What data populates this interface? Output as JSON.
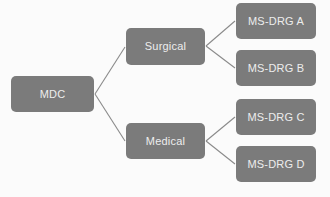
{
  "diagram": {
    "background_color": "#fbfbfb",
    "node_fill_color": "#7b7b7b",
    "node_text_color": "#ededed",
    "edge_color": "#8a8a8a",
    "nodes": [
      {
        "id": "mdc",
        "label": "MDC",
        "level": 1
      },
      {
        "id": "surgical",
        "label": "Surgical",
        "level": 2
      },
      {
        "id": "medical",
        "label": "Medical",
        "level": 2
      },
      {
        "id": "msdrg_a",
        "label": "MS-DRG A",
        "level": 3
      },
      {
        "id": "msdrg_b",
        "label": "MS-DRG B",
        "level": 3
      },
      {
        "id": "msdrg_c",
        "label": "MS-DRG C",
        "level": 3
      },
      {
        "id": "msdrg_d",
        "label": "MS-DRG D",
        "level": 3
      }
    ],
    "edges": [
      {
        "from": "mdc",
        "to": "surgical"
      },
      {
        "from": "mdc",
        "to": "medical"
      },
      {
        "from": "surgical",
        "to": "msdrg_a"
      },
      {
        "from": "surgical",
        "to": "msdrg_b"
      },
      {
        "from": "medical",
        "to": "msdrg_c"
      },
      {
        "from": "medical",
        "to": "msdrg_d"
      }
    ]
  }
}
